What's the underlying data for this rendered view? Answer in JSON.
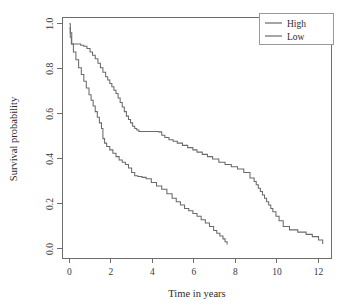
{
  "chart_data": {
    "type": "line",
    "subtype": "kaplan-meier-step",
    "title": "",
    "xlabel": "Time in years",
    "ylabel": "Survival probability",
    "xlim": [
      -0.35,
      12.6
    ],
    "ylim": [
      -0.04,
      1.03
    ],
    "xticks": [
      0,
      2,
      4,
      6,
      8,
      10,
      12
    ],
    "xtick_labels": [
      "0",
      "2",
      "4",
      "6",
      "8",
      "10",
      "12"
    ],
    "yticks": [
      0.0,
      0.2,
      0.4,
      0.6,
      0.8,
      1.0
    ],
    "ytick_labels": [
      "0.0",
      "0.2",
      "0.4",
      "0.6",
      "0.8",
      "1.0"
    ],
    "grid": false,
    "legend_position": "top-right",
    "legend_entries": [
      "High",
      "Low"
    ],
    "colors": {
      "high": "#6a6a6a",
      "low": "#6a6a6a",
      "axis": "#6d6d6d",
      "text": "#2b2b2b",
      "background": "#ffffff"
    },
    "series": [
      {
        "name": "High",
        "color": "#6a6a6a",
        "x": [
          0.0,
          0.05,
          0.12,
          0.55,
          0.7,
          0.85,
          1.0,
          1.12,
          1.25,
          1.38,
          1.5,
          1.62,
          1.75,
          1.85,
          1.95,
          2.05,
          2.15,
          2.25,
          2.35,
          2.45,
          2.55,
          2.65,
          2.75,
          2.85,
          2.95,
          3.05,
          3.15,
          3.25,
          3.35,
          4.3,
          4.45,
          4.6,
          4.8,
          5.0,
          5.2,
          5.45,
          5.7,
          5.95,
          6.15,
          6.4,
          6.65,
          6.9,
          7.2,
          7.5,
          7.8,
          8.1,
          8.4,
          8.7,
          8.9,
          9.0,
          9.1,
          9.2,
          9.3,
          9.4,
          9.5,
          9.6,
          9.7,
          9.8,
          9.95,
          10.1,
          10.3,
          10.6,
          11.0,
          11.4,
          11.7,
          12.0,
          12.2
        ],
        "y": [
          1.0,
          0.96,
          0.91,
          0.905,
          0.9,
          0.89,
          0.875,
          0.86,
          0.845,
          0.825,
          0.805,
          0.785,
          0.765,
          0.75,
          0.735,
          0.72,
          0.705,
          0.69,
          0.67,
          0.65,
          0.63,
          0.61,
          0.59,
          0.575,
          0.56,
          0.545,
          0.535,
          0.528,
          0.522,
          0.52,
          0.505,
          0.495,
          0.485,
          0.478,
          0.47,
          0.46,
          0.45,
          0.44,
          0.43,
          0.42,
          0.41,
          0.4,
          0.385,
          0.375,
          0.365,
          0.355,
          0.34,
          0.315,
          0.3,
          0.285,
          0.27,
          0.255,
          0.24,
          0.225,
          0.21,
          0.195,
          0.18,
          0.165,
          0.145,
          0.125,
          0.1,
          0.085,
          0.075,
          0.065,
          0.055,
          0.04,
          0.022
        ]
      },
      {
        "name": "Low",
        "color": "#6a6a6a",
        "x": [
          0.0,
          0.05,
          0.1,
          0.2,
          0.32,
          0.45,
          0.58,
          0.7,
          0.82,
          0.95,
          1.05,
          1.15,
          1.25,
          1.35,
          1.45,
          1.55,
          1.62,
          1.7,
          1.8,
          1.95,
          2.1,
          2.25,
          2.4,
          2.55,
          2.7,
          2.85,
          3.0,
          3.15,
          3.3,
          3.5,
          3.7,
          3.95,
          4.2,
          4.45,
          4.7,
          4.95,
          5.15,
          5.35,
          5.55,
          5.75,
          5.95,
          6.15,
          6.35,
          6.55,
          6.75,
          6.95,
          7.1,
          7.25,
          7.4,
          7.5,
          7.6
        ],
        "y": [
          0.98,
          0.94,
          0.91,
          0.875,
          0.84,
          0.805,
          0.775,
          0.745,
          0.715,
          0.685,
          0.66,
          0.635,
          0.61,
          0.585,
          0.56,
          0.535,
          0.49,
          0.47,
          0.455,
          0.44,
          0.425,
          0.41,
          0.395,
          0.385,
          0.375,
          0.36,
          0.34,
          0.325,
          0.322,
          0.318,
          0.312,
          0.295,
          0.28,
          0.265,
          0.245,
          0.225,
          0.21,
          0.195,
          0.18,
          0.17,
          0.158,
          0.145,
          0.13,
          0.115,
          0.1,
          0.082,
          0.07,
          0.058,
          0.045,
          0.032,
          0.02
        ]
      }
    ]
  },
  "legend": {
    "items": [
      {
        "label": "High",
        "color": "#6a6a6a"
      },
      {
        "label": "Low",
        "color": "#6a6a6a"
      }
    ]
  },
  "axes": {
    "x_title": "Time in years",
    "y_title": "Survival probability"
  }
}
